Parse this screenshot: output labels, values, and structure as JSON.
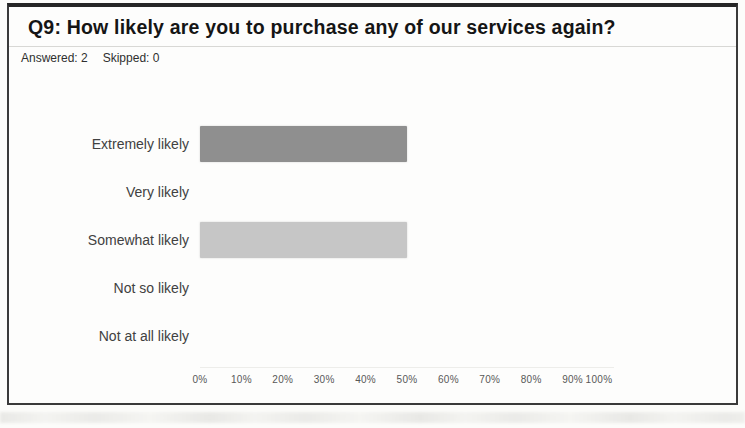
{
  "card": {
    "title": "Q9: How likely are you to purchase any of our services again?",
    "answered_label": "Answered: 2",
    "skipped_label": "Skipped: 0"
  },
  "chart_data": {
    "type": "bar",
    "orientation": "horizontal",
    "title": "Q9: How likely are you to purchase any of our services again?",
    "answered": 2,
    "skipped": 0,
    "categories": [
      "Extremely likely",
      "Very likely",
      "Somewhat likely",
      "Not so likely",
      "Not at all likely"
    ],
    "values": [
      50,
      0,
      50,
      0,
      0
    ],
    "value_unit": "%",
    "xlim": [
      0,
      100
    ],
    "x_ticks": [
      "0%",
      "10%",
      "20%",
      "30%",
      "40%",
      "50%",
      "60%",
      "70%",
      "80%",
      "90%",
      "100%"
    ],
    "grid": false,
    "legend": false,
    "bar_colors": [
      "#8f8f8f",
      "#8f8f8f",
      "#c6c6c6",
      "#c6c6c6",
      "#c6c6c6"
    ]
  }
}
